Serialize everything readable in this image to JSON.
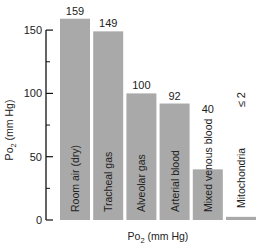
{
  "chart_data": {
    "type": "bar",
    "title": "",
    "xlabel": "Po2 (mm Hg)",
    "xlabel_main": "Po",
    "xlabel_sub": "2",
    "xlabel_rest": " (mm Hg)",
    "ylabel_main": "Po",
    "ylabel_sub": "2",
    "ylabel_rest": " (mm Hg)",
    "ylim": [
      0,
      160
    ],
    "yticks": [
      0,
      50,
      100,
      150
    ],
    "ytick_labels": [
      "0",
      "50",
      "100",
      "150"
    ],
    "minor_yticks": [
      25,
      75,
      125
    ],
    "grid": false,
    "categories": [
      "Room air (dry)",
      "Tracheal gas",
      "Alveolar gas",
      "Arterial blood",
      "Mixed venous blood",
      "Mitochondria"
    ],
    "values": [
      159,
      149,
      100,
      92,
      40,
      2
    ],
    "value_labels": [
      "159",
      "149",
      "100",
      "92",
      "40",
      "≤ 2"
    ],
    "colors": {
      "bar": "#a9a9a9",
      "axis": "#111111",
      "text": "#222222"
    }
  }
}
